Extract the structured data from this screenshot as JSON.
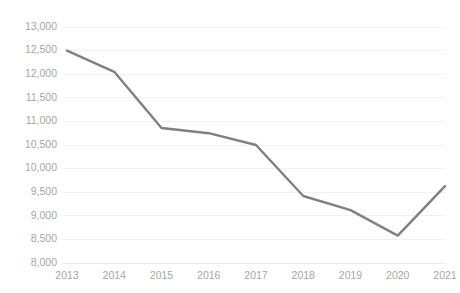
{
  "chart_data": {
    "type": "line",
    "title": "",
    "subtitle": "",
    "xlabel": "",
    "ylabel": "",
    "categories": [
      "2013",
      "2014",
      "2015",
      "2016",
      "2017",
      "2018",
      "2019",
      "2020",
      "2021"
    ],
    "values": [
      12500,
      12050,
      10860,
      10750,
      10500,
      9420,
      9120,
      8580,
      9630
    ],
    "series": [
      {
        "name": "",
        "values": [
          12500,
          12050,
          10860,
          10750,
          10500,
          9420,
          9120,
          8580,
          9630
        ]
      }
    ],
    "ylim": [
      8000,
      13000
    ],
    "ystep": 500,
    "ytick_labels": [
      "13,000",
      "12,500",
      "12,000",
      "11,500",
      "11,000",
      "10,500",
      "10,000",
      "9,500",
      "9,000",
      "8,500",
      "8,000"
    ],
    "ytick_values": [
      13000,
      12500,
      12000,
      11500,
      11000,
      10500,
      10000,
      9500,
      9000,
      8500,
      8000
    ],
    "xtick_labels": [
      "2013",
      "2014",
      "2015",
      "2016",
      "2017",
      "2018",
      "2019",
      "2020",
      "2021"
    ],
    "grid": "horizontal",
    "legend": "none",
    "markers": "none",
    "colors": {
      "line": "#808080",
      "gridline": "#f0f0f0",
      "axis": "#e8e8e8",
      "tick_label": "#a6a6a6",
      "background": "#ffffff"
    },
    "annotations": []
  },
  "plot_geometry": {
    "left": 67,
    "right": 445,
    "top": 27,
    "bottom": 263
  }
}
